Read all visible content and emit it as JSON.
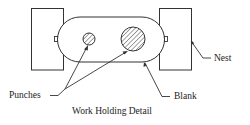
{
  "diagram": {
    "caption": "Work Holding Detail",
    "labels": {
      "punches": "Punches",
      "blank": "Blank",
      "nest": "Nest"
    },
    "colors": {
      "stroke": "#333333",
      "background": "#ffffff",
      "text": "#222222"
    },
    "components": [
      {
        "name": "left-nest",
        "type": "rectangle"
      },
      {
        "name": "right-nest",
        "type": "rectangle"
      },
      {
        "name": "blank",
        "type": "stadium"
      },
      {
        "name": "small-punch",
        "type": "hatched-circle"
      },
      {
        "name": "large-punch",
        "type": "hatched-circle"
      }
    ]
  }
}
